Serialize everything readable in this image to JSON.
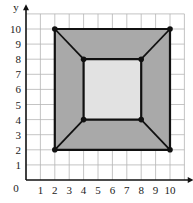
{
  "axes": {
    "x_label": "x",
    "y_label": "y",
    "origin_label": "0",
    "x_ticks": [
      "1",
      "2",
      "3",
      "4",
      "5",
      "6",
      "7",
      "8",
      "9",
      "10"
    ],
    "y_ticks": [
      "1",
      "2",
      "3",
      "4",
      "5",
      "6",
      "7",
      "8",
      "9",
      "10"
    ]
  },
  "figure": {
    "outer_square": [
      [
        2,
        2
      ],
      [
        10,
        2
      ],
      [
        10,
        10
      ],
      [
        2,
        10
      ]
    ],
    "inner_square": [
      [
        4,
        4
      ],
      [
        8,
        4
      ],
      [
        8,
        8
      ],
      [
        4,
        8
      ]
    ],
    "connectors": [
      [
        [
          2,
          10
        ],
        [
          4,
          8
        ]
      ],
      [
        [
          10,
          10
        ],
        [
          8,
          8
        ]
      ],
      [
        [
          2,
          2
        ],
        [
          4,
          4
        ]
      ],
      [
        [
          10,
          2
        ],
        [
          8,
          4
        ]
      ]
    ],
    "colors": {
      "outer_fill": "#a9a9a9",
      "inner_fill": "#e2e2e2",
      "stroke": "#111111",
      "grid": "#b5b5b5"
    }
  }
}
